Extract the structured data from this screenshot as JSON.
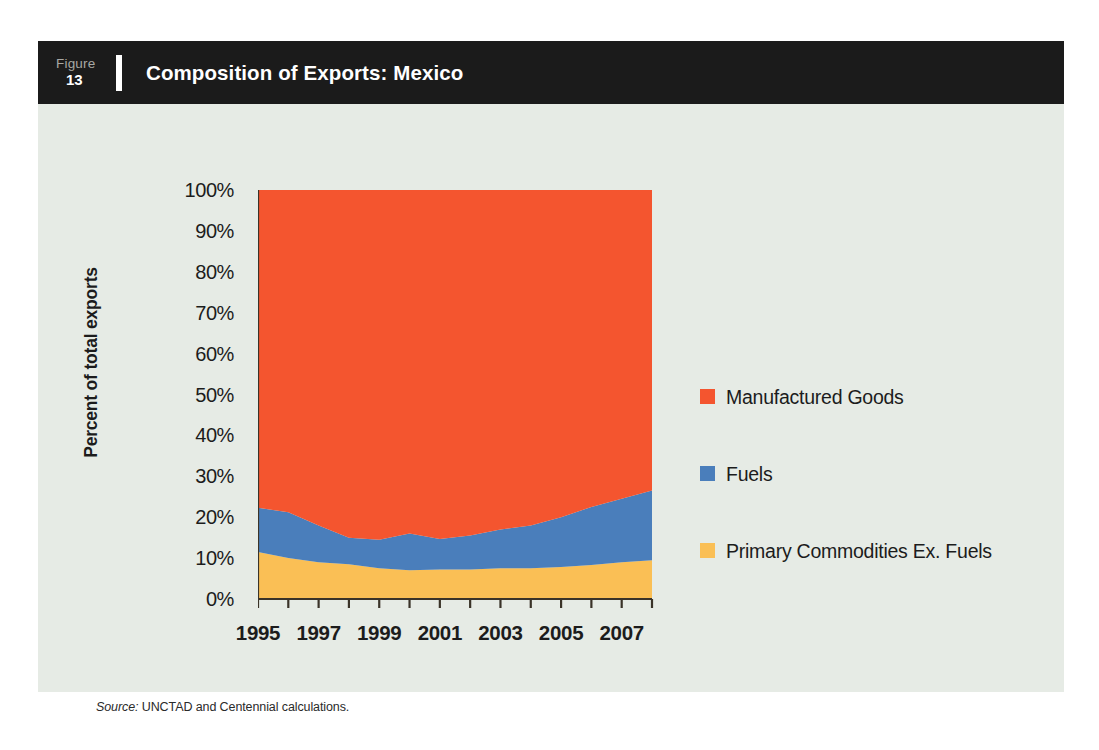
{
  "figure": {
    "label_word": "Figure",
    "number": "13",
    "title": "Composition of Exports: Mexico"
  },
  "source": {
    "prefix": "Source:",
    "text": "UNCTAD and Centennial calculations."
  },
  "colors": {
    "background": "#e6ebe5",
    "header_bar": "#1b1b1b",
    "manufactured_goods": "#f4552f",
    "fuels": "#4a7ebb",
    "primary_commodities": "#fabf55",
    "axis": "#3a3328",
    "text": "#1c1c1c"
  },
  "legend": {
    "position": "right",
    "entries": [
      {
        "label": "Manufactured Goods",
        "color": "#f4552f"
      },
      {
        "label": "Fuels",
        "color": "#4a7ebb"
      },
      {
        "label": "Primary Commodities Ex. Fuels",
        "color": "#fabf55"
      }
    ]
  },
  "chart_data": {
    "type": "area",
    "stacked": true,
    "title": "Composition of Exports: Mexico",
    "xlabel": "",
    "ylabel": "Percent of total exports",
    "ylim": [
      0,
      100
    ],
    "yticks": [
      0,
      10,
      20,
      30,
      40,
      50,
      60,
      70,
      80,
      90,
      100
    ],
    "ytick_labels": [
      "0%",
      "10%",
      "20%",
      "30%",
      "40%",
      "50%",
      "60%",
      "70%",
      "80%",
      "90%",
      "100%"
    ],
    "xlim": [
      1995,
      2008
    ],
    "x": [
      1995,
      1996,
      1997,
      1998,
      1999,
      2000,
      2001,
      2002,
      2003,
      2004,
      2005,
      2006,
      2007,
      2008
    ],
    "xticks": [
      1995,
      1996,
      1997,
      1998,
      1999,
      2000,
      2001,
      2002,
      2003,
      2004,
      2005,
      2006,
      2007,
      2008
    ],
    "xtick_labels_shown": [
      "1995",
      "1997",
      "1999",
      "2001",
      "2003",
      "2005",
      "2007"
    ],
    "xtick_labels_shown_at": [
      1995,
      1997,
      1999,
      2001,
      2003,
      2005,
      2007
    ],
    "grid": false,
    "legend_position": "right",
    "series": [
      {
        "name": "Primary Commodities Ex. Fuels",
        "color": "#fabf55",
        "values": [
          11.5,
          10.0,
          9.0,
          8.5,
          7.5,
          7.0,
          7.2,
          7.2,
          7.5,
          7.5,
          7.8,
          8.3,
          9.0,
          9.5
        ]
      },
      {
        "name": "Fuels",
        "color": "#4a7ebb",
        "values": [
          10.8,
          11.2,
          9.0,
          6.5,
          7.0,
          9.0,
          7.5,
          8.3,
          9.5,
          10.5,
          12.2,
          14.2,
          15.5,
          17.0
        ]
      },
      {
        "name": "Manufactured Goods",
        "color": "#f4552f",
        "values": [
          77.7,
          78.8,
          82.0,
          85.0,
          85.5,
          84.0,
          85.3,
          84.5,
          83.0,
          82.0,
          80.0,
          77.5,
          75.5,
          73.5
        ]
      }
    ],
    "cumulative_upper_bounds": {
      "primary_commodities": [
        11.5,
        10.0,
        9.0,
        8.5,
        7.5,
        7.0,
        7.2,
        7.2,
        7.5,
        7.5,
        7.8,
        8.3,
        9.0,
        9.5
      ],
      "primary_plus_fuels": [
        22.3,
        21.2,
        18.0,
        15.0,
        14.5,
        16.0,
        14.7,
        15.5,
        17.0,
        18.0,
        20.0,
        22.5,
        24.5,
        26.5
      ],
      "total": [
        100,
        100,
        100,
        100,
        100,
        100,
        100,
        100,
        100,
        100,
        100,
        100,
        100,
        100
      ]
    }
  }
}
